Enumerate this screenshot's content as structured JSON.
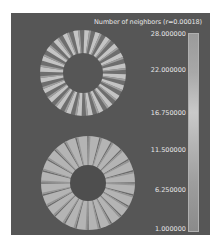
{
  "legend": {
    "title": "Number of neighbors (r=0.00018)",
    "tick_labels": [
      "28.000000",
      "22.000000",
      "16.750000",
      "11.500000",
      "6.250000",
      "1.000000"
    ],
    "colors": {
      "panel": "#565656",
      "text": "#e6e6e6"
    }
  },
  "rings": [
    {
      "name": "upper-ring",
      "spokes": 24,
      "style": "light-wedges-dark-gaps"
    },
    {
      "name": "lower-ring",
      "spokes": 24,
      "style": "light-fill-dark-spokes"
    }
  ]
}
